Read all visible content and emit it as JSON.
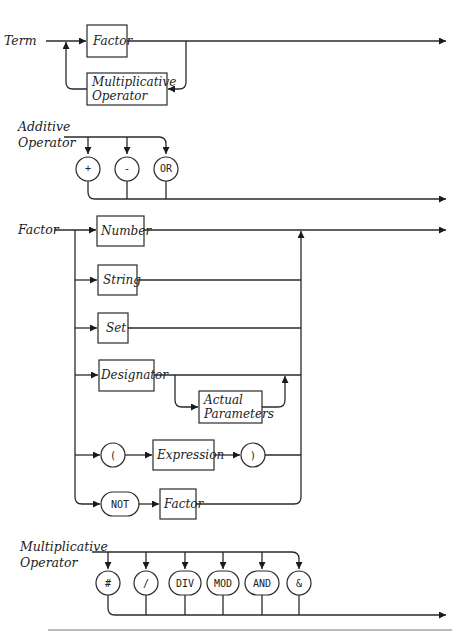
{
  "diagrams": {
    "term": {
      "label": "Term",
      "factor_box": "Factor",
      "mult_op_box": [
        "Multiplicative",
        "Operator"
      ]
    },
    "additive_operator": {
      "label": [
        "Additive",
        "Operator"
      ],
      "terminals": [
        "+",
        "-",
        "OR"
      ]
    },
    "factor": {
      "label": "Factor",
      "number_box": "Number",
      "string_box": "String",
      "set_box": "Set",
      "designator_box": "Designator",
      "actual_params_box": [
        "Actual",
        "Parameters"
      ],
      "open_paren": "(",
      "expression_box": "Expression",
      "close_paren": ")",
      "not_terminal": "NOT",
      "factor_box": "Factor"
    },
    "multiplicative_operator": {
      "label": [
        "Multiplicative",
        "Operator"
      ],
      "terminals": [
        "#",
        "/",
        "DIV",
        "MOD",
        "AND",
        "&"
      ]
    }
  },
  "colors": {
    "ink": "#2a2a2a",
    "background": "#ffffff"
  }
}
